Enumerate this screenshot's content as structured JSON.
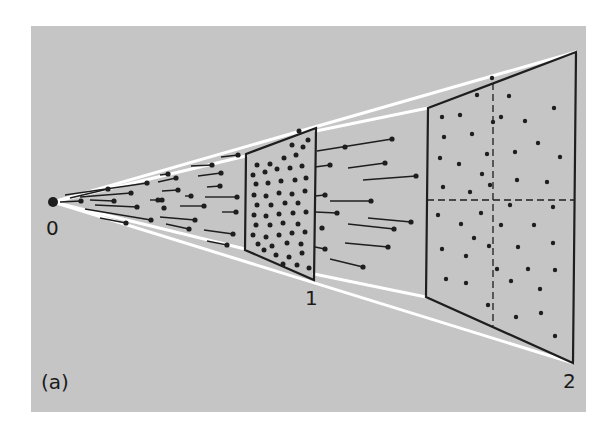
{
  "figure": {
    "panel_label": "(a)",
    "labels": {
      "origin": "0",
      "frame1": "1",
      "frame2": "2"
    },
    "colors": {
      "panel": "#c5c5c5",
      "ink": "#1e1e1e",
      "cone": "#ffffff",
      "background": "#ffffff"
    }
  },
  "geometry": {
    "origin": [
      53,
      202
    ],
    "frame1": [
      [
        246,
        154
      ],
      [
        316,
        128
      ],
      [
        314,
        280
      ],
      [
        245,
        250
      ]
    ],
    "frame2": [
      [
        428,
        108
      ],
      [
        576,
        52
      ],
      [
        573,
        363
      ],
      [
        426,
        297
      ]
    ],
    "frame2_dash_v": [
      [
        493,
        83
      ],
      [
        493,
        326
      ]
    ],
    "frame2_dash_h": [
      [
        427,
        200
      ],
      [
        574,
        200
      ]
    ],
    "cone_lines": [
      [
        [
          53,
          202
        ],
        [
          576,
          52
        ]
      ],
      [
        [
          53,
          202
        ],
        [
          573,
          363
        ]
      ],
      [
        [
          316,
          131
        ],
        [
          428,
          108
        ]
      ],
      [
        [
          314,
          274
        ],
        [
          426,
          297
        ]
      ],
      [
        [
          53,
          202
        ],
        [
          246,
          156
        ]
      ],
      [
        [
          53,
          202
        ],
        [
          245,
          249
        ]
      ]
    ]
  },
  "tracks": [
    [
      [
        65,
        195
      ],
      [
        147,
        183
      ]
    ],
    [
      [
        70,
        198
      ],
      [
        108,
        189
      ]
    ],
    [
      [
        80,
        197
      ],
      [
        131,
        193
      ]
    ],
    [
      [
        60,
        202
      ],
      [
        81,
        201
      ]
    ],
    [
      [
        90,
        200
      ],
      [
        114,
        201
      ]
    ],
    [
      [
        95,
        205
      ],
      [
        137,
        207
      ]
    ],
    [
      [
        85,
        209
      ],
      [
        151,
        220
      ]
    ],
    [
      [
        100,
        218
      ],
      [
        126,
        223
      ]
    ],
    [
      [
        221,
        157
      ],
      [
        238,
        155
      ]
    ],
    [
      [
        191,
        166
      ],
      [
        212,
        165
      ]
    ],
    [
      [
        198,
        176
      ],
      [
        221,
        173
      ]
    ],
    [
      [
        160,
        175
      ],
      [
        168,
        174
      ]
    ],
    [
      [
        158,
        182
      ],
      [
        176,
        178
      ]
    ],
    [
      [
        207,
        187
      ],
      [
        220,
        186
      ]
    ],
    [
      [
        162,
        191
      ],
      [
        178,
        190
      ]
    ],
    [
      [
        185,
        196
      ],
      [
        191,
        196
      ]
    ],
    [
      [
        205,
        197
      ],
      [
        237,
        197
      ]
    ],
    [
      [
        180,
        206
      ],
      [
        204,
        206
      ]
    ],
    [
      [
        222,
        212
      ],
      [
        236,
        212
      ]
    ],
    [
      [
        160,
        217
      ],
      [
        195,
        220
      ]
    ],
    [
      [
        166,
        224
      ],
      [
        189,
        229
      ]
    ],
    [
      [
        204,
        230
      ],
      [
        233,
        234
      ]
    ],
    [
      [
        207,
        241
      ],
      [
        227,
        245
      ]
    ],
    [
      [
        150,
        200
      ],
      [
        158,
        200
      ]
    ],
    [
      [
        317,
        151
      ],
      [
        392,
        139
      ]
    ],
    [
      [
        315,
        167
      ],
      [
        330,
        165
      ]
    ],
    [
      [
        348,
        168
      ],
      [
        385,
        163
      ]
    ],
    [
      [
        363,
        180
      ],
      [
        416,
        176
      ]
    ],
    [
      [
        315,
        196
      ],
      [
        325,
        195
      ]
    ],
    [
      [
        330,
        201
      ],
      [
        371,
        201
      ]
    ],
    [
      [
        315,
        212
      ],
      [
        337,
        213
      ]
    ],
    [
      [
        368,
        218
      ],
      [
        411,
        222
      ]
    ],
    [
      [
        348,
        224
      ],
      [
        394,
        229
      ]
    ],
    [
      [
        345,
        243
      ],
      [
        388,
        247
      ]
    ],
    [
      [
        315,
        247
      ],
      [
        325,
        249
      ]
    ],
    [
      [
        330,
        259
      ],
      [
        363,
        267
      ]
    ]
  ],
  "loose_dots": [
    [
      345,
      147
    ],
    [
      164,
      208
    ],
    [
      322,
      228
    ],
    [
      162,
      200
    ]
  ],
  "frame1_dots": [
    [
      257,
      165
    ],
    [
      270,
      164
    ],
    [
      284,
      158
    ],
    [
      296,
      155
    ],
    [
      303,
      147
    ],
    [
      308,
      140
    ],
    [
      292,
      145
    ],
    [
      299,
      131
    ],
    [
      253,
      175
    ],
    [
      265,
      172
    ],
    [
      277,
      169
    ],
    [
      290,
      168
    ],
    [
      302,
      166
    ],
    [
      256,
      184
    ],
    [
      268,
      183
    ],
    [
      281,
      181
    ],
    [
      295,
      180
    ],
    [
      306,
      178
    ],
    [
      254,
      195
    ],
    [
      266,
      196
    ],
    [
      279,
      193
    ],
    [
      292,
      194
    ],
    [
      305,
      191
    ],
    [
      257,
      205
    ],
    [
      271,
      205
    ],
    [
      285,
      203
    ],
    [
      298,
      203
    ],
    [
      254,
      215
    ],
    [
      266,
      216
    ],
    [
      279,
      214
    ],
    [
      293,
      213
    ],
    [
      306,
      212
    ],
    [
      256,
      225
    ],
    [
      270,
      225
    ],
    [
      283,
      223
    ],
    [
      298,
      224
    ],
    [
      253,
      235
    ],
    [
      266,
      237
    ],
    [
      279,
      235
    ],
    [
      292,
      233
    ],
    [
      305,
      232
    ],
    [
      258,
      244
    ],
    [
      272,
      246
    ],
    [
      287,
      243
    ],
    [
      301,
      244
    ],
    [
      276,
      255
    ],
    [
      289,
      257
    ],
    [
      302,
      253
    ],
    [
      297,
      265
    ],
    [
      283,
      264
    ],
    [
      309,
      268
    ],
    [
      264,
      250
    ]
  ],
  "frame2_dots": [
    [
      492,
      78
    ],
    [
      477,
      95
    ],
    [
      509,
      96
    ],
    [
      554,
      108
    ],
    [
      442,
      117
    ],
    [
      460,
      115
    ],
    [
      493,
      122
    ],
    [
      501,
      117
    ],
    [
      525,
      121
    ],
    [
      444,
      137
    ],
    [
      472,
      134
    ],
    [
      538,
      143
    ],
    [
      487,
      154
    ],
    [
      515,
      152
    ],
    [
      440,
      158
    ],
    [
      459,
      164
    ],
    [
      560,
      157
    ],
    [
      482,
      174
    ],
    [
      517,
      180
    ],
    [
      547,
      182
    ],
    [
      443,
      187
    ],
    [
      470,
      192
    ],
    [
      490,
      185
    ],
    [
      510,
      205
    ],
    [
      553,
      207
    ],
    [
      438,
      215
    ],
    [
      481,
      213
    ],
    [
      461,
      224
    ],
    [
      501,
      225
    ],
    [
      534,
      225
    ],
    [
      474,
      238
    ],
    [
      489,
      246
    ],
    [
      518,
      247
    ],
    [
      442,
      249
    ],
    [
      553,
      243
    ],
    [
      466,
      256
    ],
    [
      497,
      269
    ],
    [
      528,
      269
    ],
    [
      555,
      270
    ],
    [
      446,
      279
    ],
    [
      466,
      283
    ],
    [
      511,
      281
    ],
    [
      540,
      289
    ],
    [
      488,
      305
    ],
    [
      516,
      317
    ],
    [
      541,
      313
    ],
    [
      555,
      336
    ]
  ]
}
